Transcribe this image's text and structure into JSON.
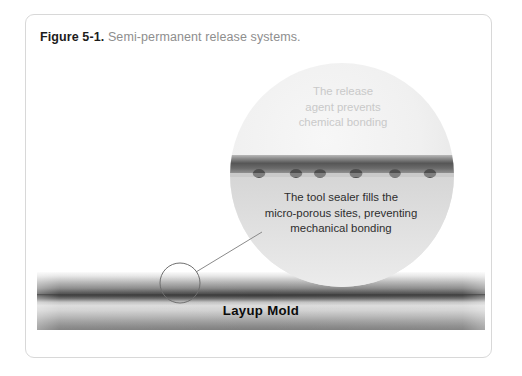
{
  "figure": {
    "caption_label": "Figure 5-1.",
    "caption_text": "Semi-permanent release systems.",
    "panel_border_color": "#d8d8d8",
    "background_color": "#ffffff"
  },
  "magnifier": {
    "name": "magnified-detail-circle",
    "fill_color": "#ededed",
    "top_annotation": {
      "color": "#c9c9c9",
      "lines": [
        "The release",
        "agent prevents",
        "chemical bonding"
      ]
    },
    "bottom_annotation": {
      "color": "#2e2e2e",
      "lines": [
        "The tool sealer fills the",
        "micro-porous sites, preventing",
        "mechanical bonding"
      ]
    },
    "release_agent_layer": {
      "name": "release-agent-band",
      "color": "#5d5d5d"
    },
    "pore_count": 6,
    "pore_color": "#4a4a4a"
  },
  "mold": {
    "label": "Layup Mold",
    "label_color": "#0b0b0b",
    "surface_line_color": "#4d4d4d"
  },
  "callout": {
    "name": "detail-callout-circle",
    "stroke_color": "#6f6f6f",
    "leader_line_color": "#8a8a8a"
  }
}
